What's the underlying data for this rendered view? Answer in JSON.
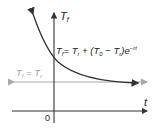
{
  "diagram": {
    "y_axis_label": "T",
    "y_axis_sub": "f",
    "x_axis_label": "t",
    "origin_label": "0",
    "equation": {
      "lhs_T": "T",
      "lhs_sub": "f",
      "eq_rhs_1": "= T",
      "rhs_1_sub": "r",
      "rhs_2": " + (T",
      "rhs_2_sub": "0",
      "rhs_3": " − T",
      "rhs_3_sub": "r",
      "rhs_4": ")e",
      "exponent": "−rt"
    },
    "asymptote_label": {
      "lhs_T": "T",
      "lhs_sub": "f",
      "eq": " = T",
      "rhs_sub": "r"
    },
    "colors": {
      "curve": "#333333",
      "axis": "#333333",
      "asymptote": "#a8a8a8",
      "asymptote_text": "#a0a0a0"
    }
  }
}
